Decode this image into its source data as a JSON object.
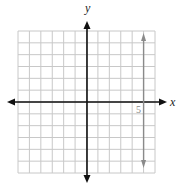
{
  "chart_data": {
    "type": "line",
    "title": "",
    "xlabel": "x",
    "ylabel": "y",
    "xlim": [
      -6,
      6
    ],
    "ylim": [
      -6,
      6
    ],
    "grid": true,
    "grid_step": 1,
    "tick_labels": [
      {
        "axis": "x",
        "value": 5,
        "label": "5"
      }
    ],
    "series": [
      {
        "name": "x = 5",
        "kind": "vertical_line",
        "x": 5,
        "arrows": "both",
        "color": "#8a8a8a"
      }
    ]
  },
  "colors": {
    "grid": "#c8c8c8",
    "axes": "#111111",
    "line": "#8a8a8a"
  }
}
